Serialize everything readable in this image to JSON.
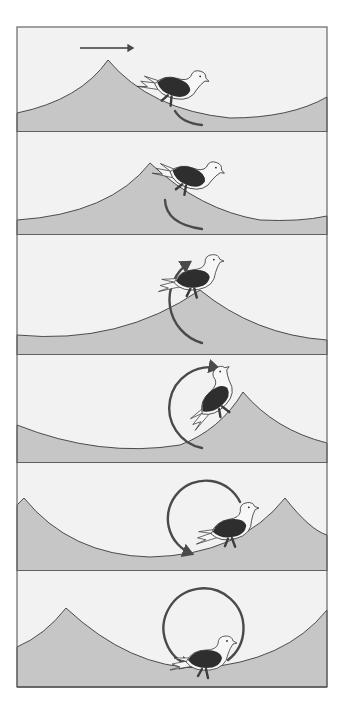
{
  "figure": {
    "frame": {
      "x": 17,
      "y": 27,
      "w": 310,
      "h": 660
    },
    "colors": {
      "sky": "#f2f2f2",
      "sea": "#c6c6c6",
      "outline": "#3a3a3a",
      "arrow": "#4a4a4a",
      "bird_back": "#2e2e2e",
      "bird_body": "#f7f7f7",
      "feet": "#3c3c3c",
      "page": "#ffffff"
    },
    "direction_arrow": {
      "x1": 80,
      "x2": 133,
      "y": 48,
      "icon": "arrow-right-icon"
    },
    "panels": [
      {
        "id": 1,
        "top": 27,
        "bottom": 132,
        "wave": "M17 113 Q80 100 108 60 Q150 110 230 118 Q290 118 327 97 L327 132 L17 132 Z",
        "bird": {
          "x": 168,
          "y": 88,
          "rot": 18
        },
        "rotation_arrow": {
          "d": "M175 111 Q182 123 202 125",
          "head": false
        }
      },
      {
        "id": 2,
        "top": 132,
        "bottom": 235,
        "wave": "M17 220 Q110 214 150 163 Q200 210 260 220 Q300 222 327 216 L327 235 L17 235 Z",
        "bird": {
          "x": 183,
          "y": 177,
          "rot": 22
        },
        "rotation_arrow": {
          "d": "M165 200 Q166 224 202 229",
          "head": false
        }
      },
      {
        "id": 3,
        "top": 235,
        "bottom": 355,
        "wave": "M17 335 Q120 345 200 290 Q255 335 327 340 L327 355 L17 355 Z",
        "bird": {
          "x": 188,
          "y": 282,
          "rot": -3
        },
        "rotation_arrow": {
          "d": "M202 343 A45 45 0 0 1 190 262",
          "head": true,
          "head_at": [
            190,
            262
          ]
        }
      },
      {
        "id": 4,
        "top": 355,
        "bottom": 463,
        "wave": "M17 425 Q100 458 180 445 Q220 430 243 392 Q275 430 327 443 L327 463 L17 463 Z",
        "bird": {
          "x": 213,
          "y": 405,
          "rot": -40
        },
        "rotation_arrow": {
          "d": "M202 448 A40 40 0 0 1 218 368",
          "head": true,
          "head_at": [
            218,
            368
          ]
        }
      },
      {
        "id": 5,
        "top": 463,
        "bottom": 571,
        "wave": "M17 505 L24 498 Q70 555 150 557 Q240 555 285 498 Q310 530 327 535 L327 571 L17 571 Z",
        "bird": {
          "x": 225,
          "y": 532,
          "rot": -8
        },
        "rotation_arrow": {
          "d": "M240 502 A38 38 0 1 0 192 554",
          "head": true,
          "head_at": [
            240,
            505
          ]
        }
      },
      {
        "id": 6,
        "top": 571,
        "bottom": 687,
        "wave": "M17 647 Q45 635 66 608 Q130 668 200 668 Q285 662 327 610 L327 687 L17 687 Z",
        "bird": {
          "x": 200,
          "y": 662,
          "rot": 0
        },
        "rotation_arrow": {
          "d": "M228 660 A40 40 0 1 0 190 666",
          "head": true,
          "head_at": [
            228,
            660
          ]
        }
      }
    ],
    "icons": {
      "bird": "seagull-icon",
      "rotation": "rotation-arrow-icon",
      "direction": "arrow-right-icon"
    }
  }
}
